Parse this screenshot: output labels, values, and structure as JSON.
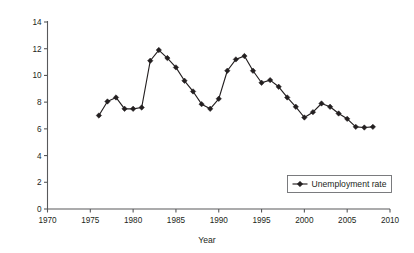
{
  "chart_data": {
    "type": "line",
    "title": "",
    "xlabel": "Year",
    "ylabel": "Percentage",
    "xlim": [
      1970,
      2010
    ],
    "ylim": [
      0,
      14
    ],
    "xticks": [
      1970,
      1975,
      1980,
      1985,
      1990,
      1995,
      2000,
      2005,
      2010
    ],
    "yticks": [
      0,
      2,
      4,
      6,
      8,
      10,
      12,
      14
    ],
    "grid": false,
    "legend_position": "lower-right",
    "series": [
      {
        "name": "Unemployment rate",
        "marker": "filled-diamond",
        "color": "#231f20",
        "x": [
          1976,
          1977,
          1978,
          1979,
          1980,
          1981,
          1982,
          1983,
          1984,
          1985,
          1986,
          1987,
          1988,
          1989,
          1990,
          1991,
          1992,
          1993,
          1994,
          1995,
          1996,
          1997,
          1998,
          1999,
          2000,
          2001,
          2002,
          2003,
          2004,
          2005,
          2006,
          2007,
          2008
        ],
        "values": [
          7.0,
          8.05,
          8.35,
          7.5,
          7.5,
          7.6,
          11.1,
          11.9,
          11.3,
          10.6,
          9.6,
          8.8,
          7.85,
          7.5,
          8.25,
          10.35,
          11.2,
          11.45,
          10.35,
          9.45,
          9.65,
          9.15,
          8.35,
          7.65,
          6.85,
          7.25,
          7.9,
          7.65,
          7.15,
          6.75,
          6.15,
          6.1,
          6.15
        ]
      }
    ]
  },
  "legend": {
    "entries": [
      {
        "label": "Unemployment rate"
      }
    ]
  },
  "axes": {
    "x_title": "Year",
    "y_title": "Percentage",
    "x_tick_labels": [
      "1970",
      "1975",
      "1980",
      "1985",
      "1990",
      "1995",
      "2000",
      "2005",
      "2010"
    ],
    "y_tick_labels": [
      "0",
      "2",
      "4",
      "6",
      "8",
      "10",
      "12",
      "14"
    ]
  }
}
